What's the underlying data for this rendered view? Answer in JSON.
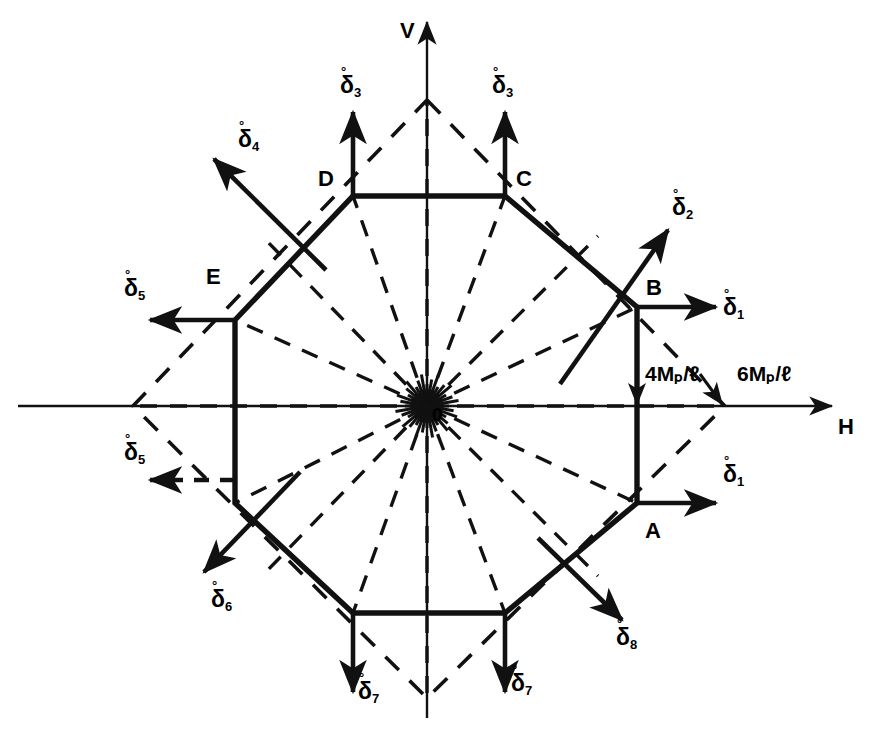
{
  "figure": {
    "type": "interaction-yield-diagram",
    "axes": {
      "horizontal_label": "H",
      "vertical_label": "V",
      "origin_label": "0"
    },
    "dimension_labels": [
      {
        "id": "inner",
        "text": "4Mₚ/ℓ",
        "value": "4Mp/l"
      },
      {
        "id": "outer",
        "text": "6Mₚ/ℓ",
        "value": "6Mp/l"
      }
    ],
    "vertex_labels": [
      {
        "id": "A",
        "text": "A"
      },
      {
        "id": "B",
        "text": "B"
      },
      {
        "id": "C",
        "text": "C"
      },
      {
        "id": "D",
        "text": "D"
      },
      {
        "id": "E",
        "text": "E"
      }
    ],
    "delta_labels": [
      {
        "id": "d1-upper",
        "base": "δ",
        "sub": "1",
        "accent": "°"
      },
      {
        "id": "d1-lower",
        "base": "δ",
        "sub": "1",
        "accent": "°"
      },
      {
        "id": "d2",
        "base": "δ",
        "sub": "2",
        "accent": "°"
      },
      {
        "id": "d3-left",
        "base": "δ",
        "sub": "3",
        "accent": "°"
      },
      {
        "id": "d3-right",
        "base": "δ",
        "sub": "3",
        "accent": "°"
      },
      {
        "id": "d4",
        "base": "δ",
        "sub": "4",
        "accent": "°"
      },
      {
        "id": "d5-upper",
        "base": "δ",
        "sub": "5",
        "accent": "°"
      },
      {
        "id": "d5-lower",
        "base": "δ",
        "sub": "5",
        "accent": "°"
      },
      {
        "id": "d6",
        "base": "δ",
        "sub": "6",
        "accent": "°"
      },
      {
        "id": "d7-left",
        "base": "δ",
        "sub": "7",
        "accent": "°"
      },
      {
        "id": "d7-right",
        "base": "δ",
        "sub": "7",
        "accent": "°"
      },
      {
        "id": "d8",
        "base": "δ",
        "sub": "8",
        "accent": "°"
      }
    ],
    "colors": {
      "ink": "#111111"
    }
  },
  "chart_data": {
    "type": "line",
    "title": "",
    "xlabel": "H",
    "ylabel": "V",
    "grid": false,
    "legend": null,
    "axis_origin_px": [
      427,
      406
    ],
    "series": [
      {
        "name": "octagon-yield-surface",
        "style": "solid",
        "closed": true,
        "points_px": [
          [
            637,
            307
          ],
          [
            637,
            503
          ],
          [
            505,
            613
          ],
          [
            353,
            613
          ],
          [
            235,
            503
          ],
          [
            235,
            320
          ],
          [
            353,
            196
          ],
          [
            505,
            196
          ]
        ],
        "labelled_vertices": {
          "B": [
            637,
            307
          ],
          "A": [
            637,
            503
          ],
          "E": [
            235,
            320
          ],
          "D": [
            353,
            196
          ],
          "C": [
            505,
            196
          ]
        }
      },
      {
        "name": "diamond-envelope",
        "style": "dashed",
        "closed": true,
        "points_px": [
          [
            427,
            100
          ],
          [
            725,
            406
          ],
          [
            427,
            698
          ],
          [
            133,
            406
          ]
        ]
      }
    ],
    "radial_rays": {
      "style": "dashed",
      "from_px": [
        427,
        406
      ],
      "to_px": [
        [
          637,
          307
        ],
        [
          637,
          503
        ],
        [
          505,
          613
        ],
        [
          353,
          613
        ],
        [
          235,
          503
        ],
        [
          235,
          320
        ],
        [
          353,
          196
        ],
        [
          505,
          196
        ],
        [
          725,
          406
        ],
        [
          133,
          406
        ],
        [
          427,
          100
        ],
        [
          427,
          698
        ]
      ]
    },
    "normal_vectors": [
      {
        "label": "δ₁1",
        "from_px": [
          637,
          307
        ],
        "to_px": [
          724,
          307
        ],
        "style": "solid"
      },
      {
        "label": "δ₁1",
        "from_px": [
          637,
          503
        ],
        "to_px": [
          724,
          503
        ],
        "style": "solid"
      },
      {
        "label": "δ₁2",
        "from_px": [
          568,
          376
        ],
        "to_px": [
          676,
          222
        ],
        "style": "solid"
      },
      {
        "label": "δ₁3",
        "from_px": [
          353,
          196
        ],
        "to_px": [
          353,
          104
        ],
        "style": "solid"
      },
      {
        "label": "δ₁3",
        "from_px": [
          505,
          196
        ],
        "to_px": [
          505,
          104
        ],
        "style": "solid"
      },
      {
        "label": "δ₁4",
        "from_px": [
          318,
          262
        ],
        "to_px": [
          206,
          151
        ],
        "style": "solid"
      },
      {
        "label": "δ₁5",
        "from_px": [
          235,
          320
        ],
        "to_px": [
          140,
          320
        ],
        "style": "solid"
      },
      {
        "label": "δ₁5",
        "from_px": [
          235,
          480
        ],
        "to_px": [
          140,
          480
        ],
        "style": "dashed"
      },
      {
        "label": "δ₁6",
        "from_px": [
          293,
          480
        ],
        "to_px": [
          196,
          580
        ],
        "style": "solid"
      },
      {
        "label": "δ₁7",
        "from_px": [
          353,
          613
        ],
        "to_px": [
          353,
          700
        ],
        "style": "solid"
      },
      {
        "label": "δ₁7",
        "from_px": [
          505,
          613
        ],
        "to_px": [
          505,
          700
        ],
        "style": "solid"
      },
      {
        "label": "δ₁8",
        "from_px": [
          545,
          545
        ],
        "to_px": [
          630,
          628
        ],
        "style": "solid"
      }
    ]
  }
}
